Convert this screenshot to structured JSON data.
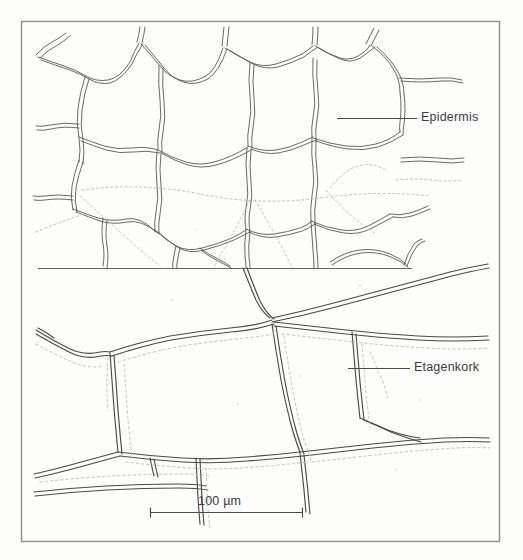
{
  "figure": {
    "kind": "botanical-line-drawing",
    "frame": {
      "x": 21,
      "y": 21,
      "width": 479,
      "height": 521,
      "stroke_color": "#8d8d8d",
      "stroke_width": 1.4
    },
    "background_color": "#fdfdfc",
    "ink_color": "#4a4a4a",
    "faint_ink_color": "#9a9a9a",
    "dotted_ink_color": "#b4b4b4"
  },
  "labels": [
    {
      "id": "epidermis",
      "text": "Epidermis",
      "leader_line": {
        "x1": 337,
        "y1": 118,
        "x2": 417,
        "y2": 118
      },
      "text_x": 421,
      "text_y": 111
    },
    {
      "id": "etagenkork",
      "text": "Etagenkork",
      "leader_line": {
        "x1": 348,
        "y1": 368,
        "x2": 410,
        "y2": 368
      },
      "text_x": 414,
      "text_y": 361
    }
  ],
  "scale_bar": {
    "label": "100 µm",
    "value": 100,
    "unit": "µm",
    "x1": 150,
    "x2": 303,
    "y": 512,
    "tick_height": 9,
    "stroke_color": "#4a4a4a",
    "text_x": 198,
    "text_y": 495
  },
  "panels": {
    "upper": {
      "name": "epidermis-cells",
      "y_range": [
        30,
        268
      ],
      "cell_wall_style": "paired wavy double lines",
      "note": "polygonal epidermal cells with sinuous anticlinal walls"
    },
    "divider": {
      "name": "panel-divider-line",
      "x1": 38,
      "x2": 412,
      "y": 268
    },
    "lower": {
      "name": "etagenkork-cells",
      "y_range": [
        268,
        490
      ],
      "cell_wall_style": "smooth single lines with dotted shadow offsets",
      "note": "large storied cork cells in tangential view"
    }
  }
}
